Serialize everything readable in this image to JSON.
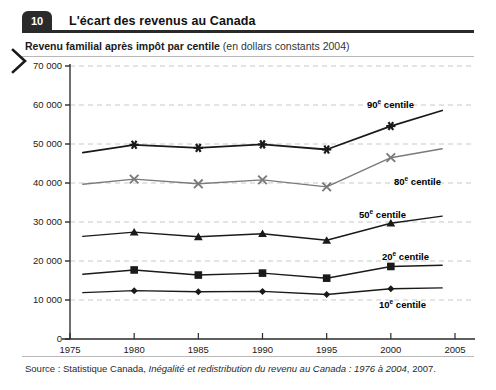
{
  "header": {
    "figure_number": "10",
    "title": "L'écart des revenus au Canada"
  },
  "subtitle": {
    "bold_part": "Revenu familial après impôt par centile",
    "light_part": "(en dollars constants 2004)"
  },
  "source": {
    "prefix": "Source : Statistique Canada, ",
    "italic": "Inégalité et redistribution du revenu au Canada : 1976 à 2004",
    "suffix": ", 2007."
  },
  "icons": {
    "chevron_right": "chevron-right-icon"
  },
  "colors": {
    "series_dark": "#1a1a1a",
    "series_gray": "#7a7a7a",
    "grid": "#c9c9c9",
    "axis": "#4a4a4a",
    "header_badge": "#2a2a2a",
    "background": "#ffffff"
  },
  "chart_data": {
    "type": "line",
    "title": "Revenu familial après impôt par centile (en dollars constants 2004)",
    "xlabel": "",
    "ylabel": "",
    "xlim": [
      1975,
      2005
    ],
    "ylim": [
      0,
      70000
    ],
    "xticks": [
      1975,
      1980,
      1985,
      1990,
      1995,
      2000,
      2005
    ],
    "yticks": [
      0,
      10000,
      20000,
      30000,
      40000,
      50000,
      60000,
      70000
    ],
    "ytick_labels": [
      "0",
      "10 000",
      "20 000",
      "30 000",
      "40 000",
      "50 000",
      "60 000",
      "70 000"
    ],
    "xtick_labels": [
      "1975",
      "1980",
      "1985",
      "1990",
      "1995",
      "2000",
      "2005"
    ],
    "grid": true,
    "grid_style": "dashed-horizontal",
    "legend": "inline-annotations",
    "x": [
      1976,
      1980,
      1985,
      1990,
      1995,
      2000,
      2004
    ],
    "series": [
      {
        "name": "90e centile",
        "label_html": "90<sup>e</sup> centile",
        "marker": "asterisk",
        "color": "#1a1a1a",
        "width": 1.8,
        "values": [
          47800,
          49800,
          49000,
          49900,
          48600,
          54600,
          58600
        ],
        "annotation_x": 367,
        "annotation_y": 98
      },
      {
        "name": "80e centile",
        "label_html": "80<sup>e</sup> centile",
        "marker": "x",
        "color": "#7a7a7a",
        "width": 1.4,
        "values": [
          39700,
          41000,
          39800,
          40800,
          39000,
          46500,
          48800
        ],
        "annotation_x": 394,
        "annotation_y": 175
      },
      {
        "name": "50e centile",
        "label_html": "50<sup>e</sup> centile",
        "marker": "triangle",
        "color": "#1a1a1a",
        "width": 1.4,
        "values": [
          26300,
          27400,
          26200,
          27000,
          25300,
          29700,
          31500
        ],
        "annotation_x": 359,
        "annotation_y": 208
      },
      {
        "name": "20e centile",
        "label_html": "20<sup>e</sup> centile",
        "marker": "square",
        "color": "#1a1a1a",
        "width": 1.4,
        "values": [
          16600,
          17700,
          16400,
          16900,
          15600,
          18600,
          18900
        ],
        "annotation_x": 382,
        "annotation_y": 250
      },
      {
        "name": "10e centile",
        "label_html": "10<sup>e</sup> centile",
        "marker": "diamond",
        "color": "#1a1a1a",
        "width": 1.4,
        "values": [
          11900,
          12400,
          12100,
          12200,
          11400,
          12900,
          13100
        ],
        "annotation_x": 379,
        "annotation_y": 298
      }
    ]
  }
}
